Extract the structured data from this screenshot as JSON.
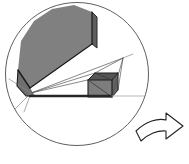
{
  "figure": {
    "title": "Geometric solid in circular frame with rotation arrow",
    "canvas": {
      "width": 189,
      "height": 164,
      "background": "#ffffff"
    },
    "colors": {
      "background": "#ffffff",
      "gray_fill": "#808080",
      "dark_gray_fill": "#5a5a5a",
      "mid_gray_fill": "#6e6e6e",
      "outline": "#1a1a1a",
      "thin_line": "#555555",
      "faint_line": "#b9b9b9",
      "circle_stroke": "#4d4d4d",
      "arrow_stroke": "#222222",
      "arrow_fill": "#ffffff"
    },
    "circle": {
      "label": "bounding-circle",
      "cx": 77,
      "cy": 74,
      "r": 71.5,
      "stroke_width": 0.9,
      "fill": "none"
    },
    "shapes": [
      {
        "name": "large-gray-wedge-top-face",
        "role": "primary solid upper face",
        "fill": "#808080",
        "points": "18,70 21,41 34,21 52,9 74,5 92,12 92,44 30,88"
      },
      {
        "name": "large-gray-wedge-side-face",
        "role": "primary solid right side face",
        "fill": "#5f5f5f",
        "points": "92,12 97,17 97,48 92,44"
      },
      {
        "name": "large-gray-wedge-lower-skirt",
        "role": "primary solid lower face",
        "fill": "#6f6f6f",
        "points": "18,70 30,88 35,96 26,96 17,86"
      },
      {
        "name": "small-box-front-face",
        "role": "secondary small solid front face",
        "fill": "#7d7d7d",
        "points": "88,80 88,97 112,97 112,80"
      },
      {
        "name": "small-box-top-face",
        "role": "secondary small solid top face",
        "fill": "#555555",
        "points": "88,80 95,73 118,73 112,80"
      },
      {
        "name": "small-box-right-face",
        "role": "secondary small solid right face",
        "fill": "#636363",
        "points": "112,80 118,73 118,90 112,97"
      }
    ],
    "edges": [
      {
        "name": "wedge-front-ridge",
        "d": "M 18 70 L 30 88",
        "width": 1.4,
        "color": "#1a1a1a"
      },
      {
        "name": "wedge-diagonal-ridge",
        "d": "M 30 88 L 92 44",
        "width": 1.2,
        "color": "#1a1a1a"
      },
      {
        "name": "wedge-right-vertical",
        "d": "M 92 12 L 92 44",
        "width": 1.2,
        "color": "#1a1a1a"
      },
      {
        "name": "wedge-right-bevel",
        "d": "M 92 12 L 97 17 L 97 48 L 92 44",
        "width": 1.0,
        "color": "#2a2a2a"
      },
      {
        "name": "wedge-left-skirt-edge",
        "d": "M 18 70 L 17 86 L 26 96 L 35 96",
        "width": 1.1,
        "color": "#1a1a1a"
      },
      {
        "name": "baseline-thick",
        "d": "M 30 96 L 112 96",
        "width": 2.6,
        "color": "#262626"
      },
      {
        "name": "baseline-extension-faint",
        "d": "M 112 96 L 160 96",
        "width": 1.0,
        "color": "#b9b9b9"
      },
      {
        "name": "small-box-outline",
        "d": "M 88 80 L 88 97 L 112 97 L 112 80 Z",
        "width": 1.1,
        "color": "#1a1a1a"
      },
      {
        "name": "small-box-top-outline",
        "d": "M 88 80 L 95 73 L 118 73 L 112 80",
        "width": 1.0,
        "color": "#1a1a1a"
      },
      {
        "name": "small-box-right-outline",
        "d": "M 118 73 L 118 90 L 112 97",
        "width": 1.0,
        "color": "#2a2a2a"
      },
      {
        "name": "small-box-diagonal-a",
        "d": "M 88 80 L 112 97",
        "width": 0.8,
        "color": "#333333"
      },
      {
        "name": "small-box-diagonal-b",
        "d": "M 95 73 L 112 80",
        "width": 0.8,
        "color": "#333333"
      }
    ],
    "construction_lines": [
      {
        "name": "ray-apex-to-upper-right",
        "d": "M 31 93 L 123 58",
        "width": 0.7,
        "color": "#555555"
      },
      {
        "name": "ray-apex-to-box-top",
        "d": "M 31 93 L 118 73",
        "width": 0.7,
        "color": "#555555"
      },
      {
        "name": "ray-apex-to-box-corner",
        "d": "M 31 93 L 95 73",
        "width": 0.7,
        "color": "#555555"
      },
      {
        "name": "ray-upper-right-to-box-right",
        "d": "M 123 58 L 118 90",
        "width": 0.7,
        "color": "#555555"
      },
      {
        "name": "ray-upper-right-to-box-top",
        "d": "M 123 58 L 95 73",
        "width": 0.7,
        "color": "#555555"
      },
      {
        "name": "ray-upper-right-to-box-base",
        "d": "M 123 58 L 112 97",
        "width": 0.7,
        "color": "#555555"
      },
      {
        "name": "ray-apex-to-left-lower-arc",
        "d": "M 31 93 L 9 79",
        "width": 0.7,
        "color": "#777777"
      },
      {
        "name": "ray-apex-to-left-bottom",
        "d": "M 31 93 L 14 110",
        "width": 0.7,
        "color": "#777777"
      },
      {
        "name": "ray-apex-down-left",
        "d": "M 31 93 L 24 112",
        "width": 0.7,
        "color": "#777777"
      },
      {
        "name": "upper-right-vertex-to-circle",
        "d": "M 123 58 L 131 55",
        "width": 0.7,
        "color": "#777777"
      }
    ],
    "arrow": {
      "name": "rotation-arrow",
      "description": "curved arrow pointing right and slightly down, outside circle at lower right",
      "fill": "#ffffff",
      "stroke": "#222222",
      "stroke_width": 1.1,
      "path": "M 136 131 C 146 121 158 118 166 120 L 166 113 L 183 126 L 166 139 L 166 131 C 158 130 148 134 141 141 Z"
    }
  }
}
